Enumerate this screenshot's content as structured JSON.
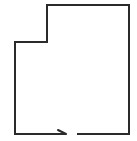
{
  "diagram": {
    "type": "floor-plan-outline",
    "stroke_color": "#2b2b2b",
    "background": "#ffffff",
    "stroke_width": 2,
    "outline_points": [
      [
        66,
        134
      ],
      [
        15,
        134
      ],
      [
        15,
        42
      ],
      [
        47,
        42
      ],
      [
        47,
        5
      ],
      [
        129,
        5
      ],
      [
        129,
        134
      ],
      [
        77,
        134
      ]
    ],
    "entrance": {
      "label": "",
      "gap_start_x": 66,
      "gap_end_x": 77,
      "y": 134,
      "arrow_tip": [
        66,
        134
      ],
      "arrow_tail": [
        58,
        130
      ]
    }
  }
}
